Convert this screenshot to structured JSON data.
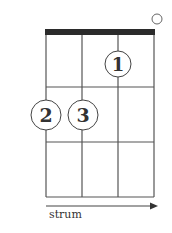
{
  "diagram": {
    "type": "ukulele-chord-chart",
    "strings": 4,
    "frets_shown": 3,
    "open_strings": [
      4
    ],
    "fingers": [
      {
        "string": 3,
        "fret": 1,
        "label": "1"
      },
      {
        "string": 1,
        "fret": 2,
        "label": "2"
      },
      {
        "string": 2,
        "fret": 2,
        "label": "3"
      }
    ],
    "strum_label": "strum",
    "colors": {
      "line": "#555555",
      "nut": "#2b2b2b",
      "text": "#333333"
    }
  }
}
